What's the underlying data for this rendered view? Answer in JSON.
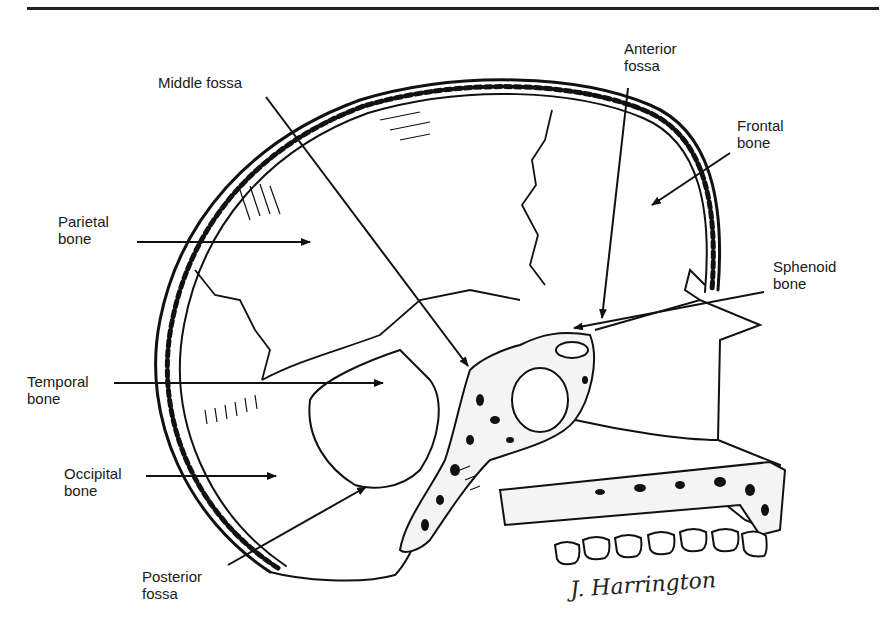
{
  "figure": {
    "signature": "J. Harrington"
  },
  "labels": {
    "middle_fossa": "Middle fossa",
    "anterior_fossa": "Anterior\nfossa",
    "frontal_bone": "Frontal\nbone",
    "parietal_bone": "Parietal\nbone",
    "sphenoid_bone": "Sphenoid\nbone",
    "temporal_bone": "Temporal\nbone",
    "occipital_bone": "Occipital\nbone",
    "posterior_fossa": "Posterior\nfossa"
  },
  "colors": {
    "ink": "#111111",
    "paper": "#ffffff"
  }
}
